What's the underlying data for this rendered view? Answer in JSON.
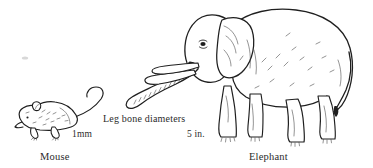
{
  "figure": {
    "background_color": "#ffffff",
    "ink_color": "#1f1f1f",
    "annotation": {
      "text": "Leg bone diameters"
    },
    "scales": [
      {
        "id": "mouse-scale",
        "text": "1mm"
      },
      {
        "id": "elephant-scale",
        "text": "5 in."
      }
    ],
    "subjects": [
      {
        "id": "mouse",
        "caption": "Mouse",
        "scale_label": "1mm",
        "facing": "left",
        "icon": "mouse-illustration"
      },
      {
        "id": "elephant",
        "caption": "Elephant",
        "scale_label": "5 in.",
        "facing": "left",
        "icon": "elephant-illustration"
      }
    ]
  }
}
